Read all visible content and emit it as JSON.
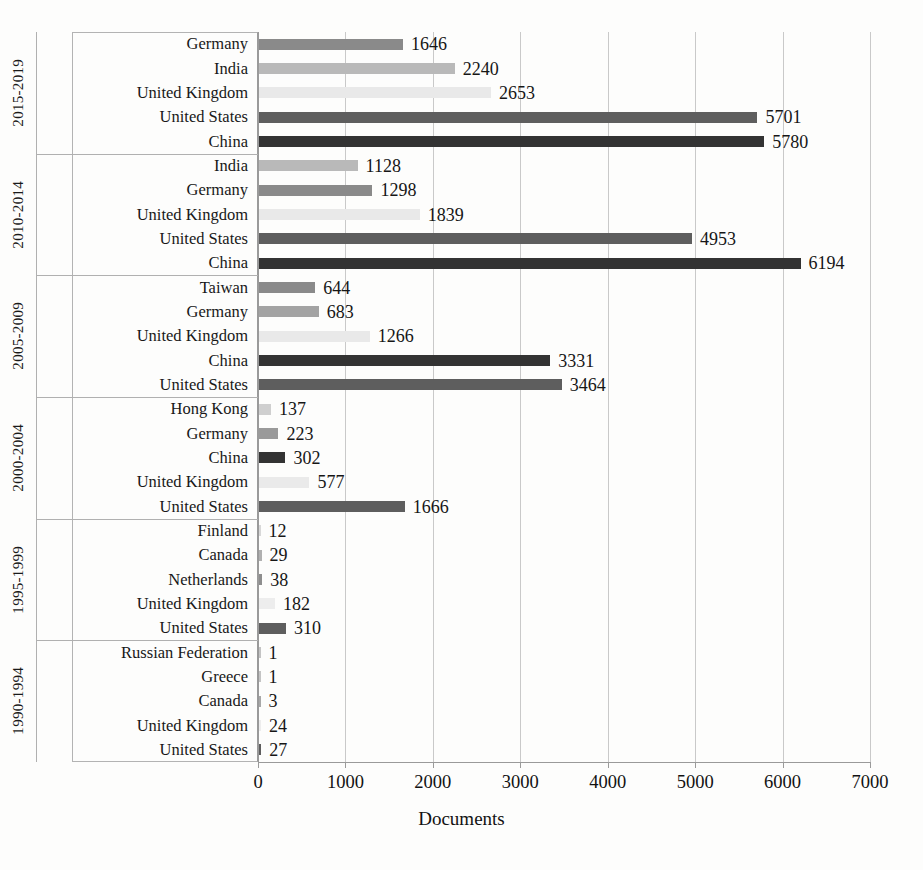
{
  "chart_data": {
    "type": "bar",
    "orientation": "horizontal",
    "title": "",
    "xlabel": "Documents",
    "ylabel": "",
    "xlim": [
      0,
      7000
    ],
    "xticks": [
      0,
      1000,
      2000,
      3000,
      4000,
      5000,
      6000,
      7000
    ],
    "xtick_labels": [
      "0",
      "1000",
      "2000",
      "3000",
      "4000",
      "5000",
      "6000",
      "7000"
    ],
    "grid": true,
    "legend": "none",
    "groups": [
      {
        "period": "2015-2019",
        "items": [
          {
            "country": "Germany",
            "value": 1646,
            "label": "1646",
            "color": "#8a8a8a"
          },
          {
            "country": "India",
            "value": 2240,
            "label": "2240",
            "color": "#b9b9b9"
          },
          {
            "country": "United Kingdom",
            "value": 2653,
            "label": "2653",
            "color": "#e9e9e9"
          },
          {
            "country": "United States",
            "value": 5701,
            "label": "5701",
            "color": "#5e5e5e"
          },
          {
            "country": "China",
            "value": 5780,
            "label": "5780",
            "color": "#333333"
          }
        ]
      },
      {
        "period": "2010-2014",
        "items": [
          {
            "country": "India",
            "value": 1128,
            "label": "1128",
            "color": "#b9b9b9"
          },
          {
            "country": "Germany",
            "value": 1298,
            "label": "1298",
            "color": "#8a8a8a"
          },
          {
            "country": "United Kingdom",
            "value": 1839,
            "label": "1839",
            "color": "#e9e9e9"
          },
          {
            "country": "United States",
            "value": 4953,
            "label": "4953",
            "color": "#5e5e5e"
          },
          {
            "country": "China",
            "value": 6194,
            "label": "6194",
            "color": "#333333"
          }
        ]
      },
      {
        "period": "2005-2009",
        "items": [
          {
            "country": "Taiwan",
            "value": 644,
            "label": "644",
            "color": "#8a8a8a"
          },
          {
            "country": "Germany",
            "value": 683,
            "label": "683",
            "color": "#a3a3a3"
          },
          {
            "country": "United Kingdom",
            "value": 1266,
            "label": "1266",
            "color": "#e9e9e9"
          },
          {
            "country": "China",
            "value": 3331,
            "label": "3331",
            "color": "#333333"
          },
          {
            "country": "United States",
            "value": 3464,
            "label": "3464",
            "color": "#5e5e5e"
          }
        ]
      },
      {
        "period": "2000-2004",
        "items": [
          {
            "country": "Hong Kong",
            "value": 137,
            "label": "137",
            "color": "#cfcfcf"
          },
          {
            "country": "Germany",
            "value": 223,
            "label": "223",
            "color": "#9a9a9a"
          },
          {
            "country": "China",
            "value": 302,
            "label": "302",
            "color": "#333333"
          },
          {
            "country": "United Kingdom",
            "value": 577,
            "label": "577",
            "color": "#eaeaea"
          },
          {
            "country": "United States",
            "value": 1666,
            "label": "1666",
            "color": "#5e5e5e"
          }
        ]
      },
      {
        "period": "1995-1999",
        "items": [
          {
            "country": "Finland",
            "value": 12,
            "label": "12",
            "color": "#d8d8d8"
          },
          {
            "country": "Canada",
            "value": 29,
            "label": "29",
            "color": "#b0b0b0"
          },
          {
            "country": "Netherlands",
            "value": 38,
            "label": "38",
            "color": "#8e8e8e"
          },
          {
            "country": "United Kingdom",
            "value": 182,
            "label": "182",
            "color": "#ededed"
          },
          {
            "country": "United States",
            "value": 310,
            "label": "310",
            "color": "#5e5e5e"
          }
        ]
      },
      {
        "period": "1990-1994",
        "items": [
          {
            "country": "Russian Federation",
            "value": 1,
            "label": "1",
            "color": "#c4c4c4"
          },
          {
            "country": "Greece",
            "value": 1,
            "label": "1",
            "color": "#c4c4c4"
          },
          {
            "country": "Canada",
            "value": 3,
            "label": "3",
            "color": "#a8a8a8"
          },
          {
            "country": "United Kingdom",
            "value": 24,
            "label": "24",
            "color": "#ededed"
          },
          {
            "country": "United States",
            "value": 27,
            "label": "27",
            "color": "#5e5e5e"
          }
        ]
      }
    ]
  },
  "colors": {
    "background": "#fdfdfc",
    "gridline": "#c9c9c9",
    "axis": "#9a9a9a",
    "text": "#1c1c1c"
  }
}
